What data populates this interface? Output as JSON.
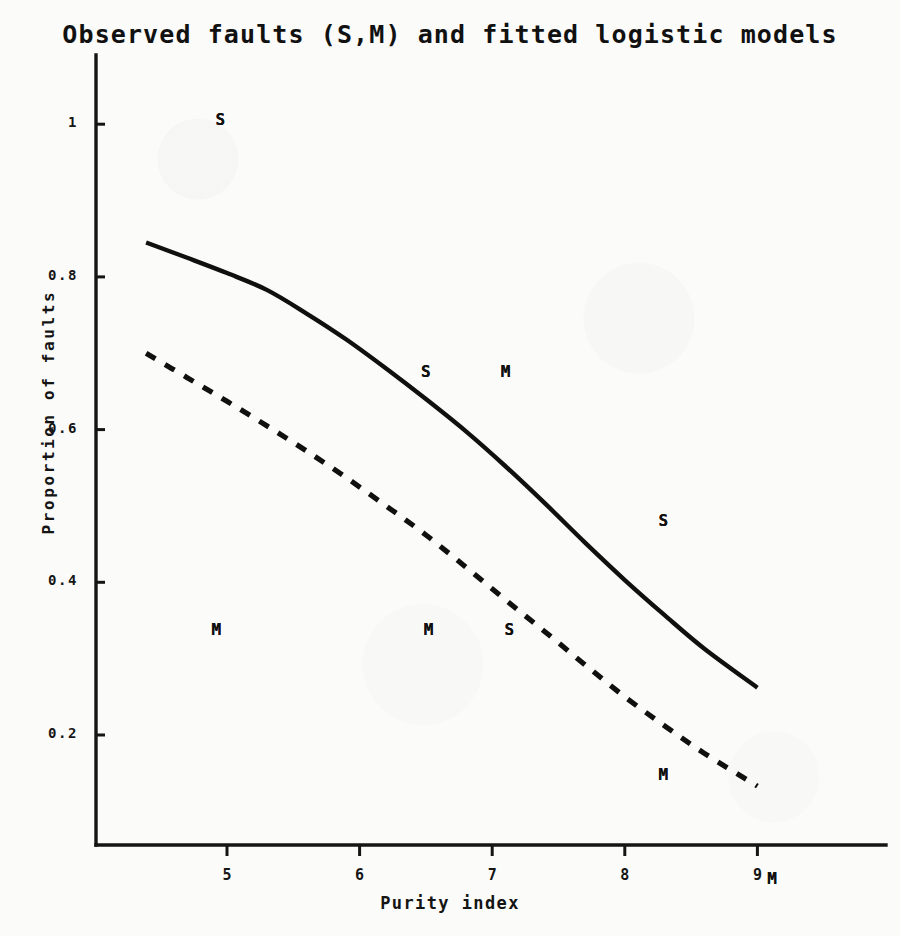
{
  "chart_data": {
    "type": "line",
    "title": "Observed faults (S,M) and fitted logistic models",
    "xlabel": "Purity index",
    "ylabel": "Proportion of faults",
    "xlim": [
      4.0,
      9.95
    ],
    "ylim": [
      0.0,
      1.1
    ],
    "grid": false,
    "legend": "none",
    "xticks": [
      {
        "value": 5,
        "label": "5"
      },
      {
        "value": 6,
        "label": "6"
      },
      {
        "value": 7,
        "label": "7"
      },
      {
        "value": 8,
        "label": "8"
      },
      {
        "value": 9,
        "label": "9"
      }
    ],
    "yticks": [
      {
        "value": 0.2,
        "label": "0.2"
      },
      {
        "value": 0.4,
        "label": "0.4"
      },
      {
        "value": 0.6,
        "label": "0.6"
      },
      {
        "value": 0.8,
        "label": "0.8"
      },
      {
        "value": 1.0,
        "label": "1"
      }
    ],
    "series": [
      {
        "name": "fitted logistic model S",
        "style": "solid",
        "color": "#101010",
        "points": [
          [
            4.39,
            0.845
          ],
          [
            4.7,
            0.825
          ],
          [
            5.0,
            0.805
          ],
          [
            5.3,
            0.783
          ],
          [
            5.6,
            0.752
          ],
          [
            5.9,
            0.718
          ],
          [
            6.2,
            0.68
          ],
          [
            6.5,
            0.64
          ],
          [
            6.8,
            0.598
          ],
          [
            7.1,
            0.552
          ],
          [
            7.4,
            0.503
          ],
          [
            7.7,
            0.452
          ],
          [
            8.0,
            0.403
          ],
          [
            8.3,
            0.357
          ],
          [
            8.6,
            0.313
          ],
          [
            9.0,
            0.262
          ]
        ]
      },
      {
        "name": "fitted logistic model M",
        "style": "dashed",
        "color": "#101010",
        "points": [
          [
            4.39,
            0.7
          ],
          [
            4.7,
            0.668
          ],
          [
            5.0,
            0.637
          ],
          [
            5.3,
            0.605
          ],
          [
            5.6,
            0.572
          ],
          [
            5.9,
            0.537
          ],
          [
            6.2,
            0.5
          ],
          [
            6.5,
            0.462
          ],
          [
            6.8,
            0.42
          ],
          [
            7.1,
            0.377
          ],
          [
            7.4,
            0.335
          ],
          [
            7.7,
            0.292
          ],
          [
            8.0,
            0.25
          ],
          [
            8.3,
            0.212
          ],
          [
            8.6,
            0.176
          ],
          [
            9.0,
            0.133
          ]
        ]
      }
    ],
    "observed_points": [
      {
        "label": "S",
        "x": 4.95,
        "y": 1.005
      },
      {
        "label": "S",
        "x": 6.5,
        "y": 0.675
      },
      {
        "label": "S",
        "x": 7.13,
        "y": 0.338
      },
      {
        "label": "S",
        "x": 8.29,
        "y": 0.48
      },
      {
        "label": "M",
        "x": 4.92,
        "y": 0.337
      },
      {
        "label": "M",
        "x": 6.52,
        "y": 0.337
      },
      {
        "label": "M",
        "x": 7.1,
        "y": 0.675
      },
      {
        "label": "M",
        "x": 8.29,
        "y": 0.147
      },
      {
        "label": "M",
        "x": 9.11,
        "y": 0.012
      }
    ]
  }
}
